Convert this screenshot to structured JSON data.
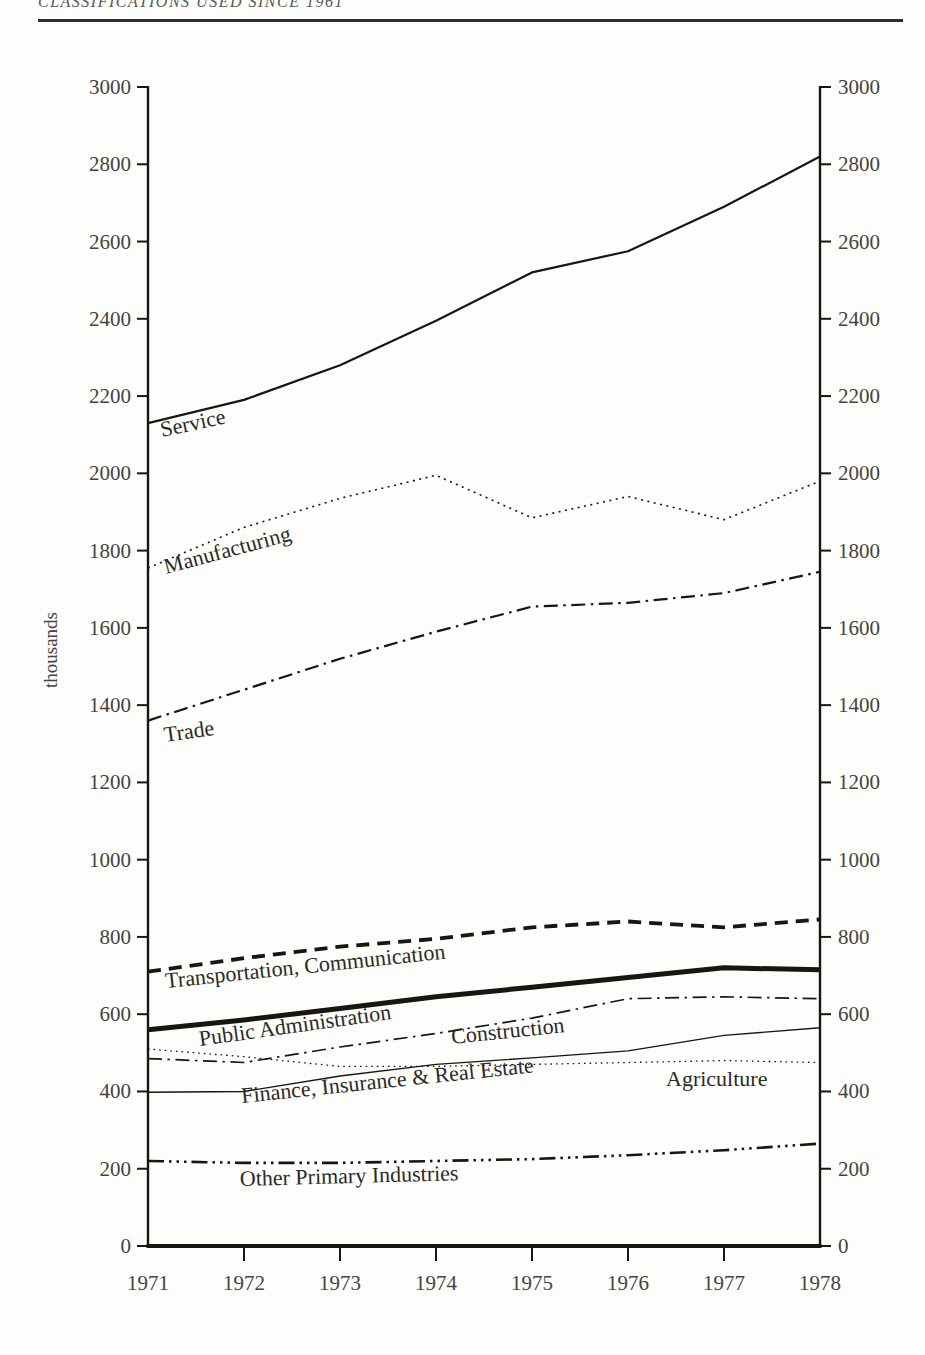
{
  "page": {
    "header_text": "CLASSIFICATIONS USED SINCE 1961"
  },
  "chart_data": {
    "type": "line",
    "title": "",
    "xlabel": "",
    "ylabel": "thousands",
    "units": "thousands of persons",
    "x": [
      1971,
      1972,
      1973,
      1974,
      1975,
      1976,
      1977,
      1978
    ],
    "ylim": [
      0,
      3000
    ],
    "y_ticks": [
      0,
      200,
      400,
      600,
      800,
      1000,
      1200,
      1400,
      1600,
      1800,
      2000,
      2200,
      2400,
      2600,
      2800,
      3000
    ],
    "grid": false,
    "legend": "labels drawn inline along each line",
    "axes": "dual y-axis (left and right), mirrored tick labels; x ticks below baseline",
    "line_color": "#17160f",
    "series": [
      {
        "name": "Service",
        "style": "solid",
        "width": 2.2,
        "values": [
          2130,
          2190,
          2280,
          2395,
          2520,
          2575,
          2690,
          2820
        ]
      },
      {
        "name": "Manufacturing",
        "style": "dotted",
        "width": 1.6,
        "values": [
          1755,
          1860,
          1935,
          1995,
          1885,
          1940,
          1880,
          1980
        ]
      },
      {
        "name": "Trade",
        "style": "dash-dot",
        "width": 2.2,
        "values": [
          1360,
          1440,
          1520,
          1590,
          1655,
          1665,
          1690,
          1745
        ]
      },
      {
        "name": "Transportation, Communication",
        "style": "dashed",
        "width": 3.8,
        "values": [
          710,
          745,
          775,
          795,
          825,
          840,
          825,
          845
        ]
      },
      {
        "name": "Public Administration",
        "style": "solid",
        "width": 5,
        "values": [
          560,
          585,
          615,
          645,
          670,
          695,
          720,
          715
        ]
      },
      {
        "name": "Construction",
        "style": "dash-dot",
        "width": 1.7,
        "values": [
          485,
          475,
          515,
          550,
          590,
          640,
          645,
          640
        ]
      },
      {
        "name": "Agriculture",
        "style": "dotted-fine",
        "width": 1.3,
        "values": [
          510,
          490,
          465,
          465,
          470,
          475,
          480,
          475
        ]
      },
      {
        "name": "Finance, Insurance & Real Estate",
        "style": "solid",
        "width": 1.4,
        "values": [
          398,
          400,
          440,
          470,
          487,
          505,
          545,
          565
        ]
      },
      {
        "name": "Other Primary Industries",
        "style": "dash-dot-dot",
        "width": 2.6,
        "values": [
          220,
          215,
          215,
          220,
          225,
          235,
          248,
          265
        ]
      }
    ]
  }
}
